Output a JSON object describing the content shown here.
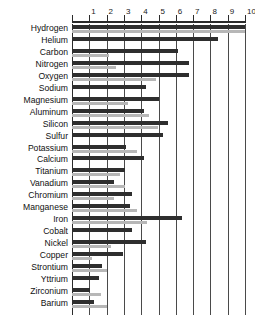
{
  "chart_data": {
    "type": "bar",
    "title": "",
    "subtitle": "",
    "xlabel": "",
    "ylabel": "",
    "orientation": "horizontal",
    "xlim": [
      0,
      10
    ],
    "grid": true,
    "grid_axis": "x",
    "axis_position": "top",
    "legend": "none",
    "tick_labels": [
      "1",
      "2",
      "3",
      "4",
      "5",
      "6",
      "7",
      "8",
      "9",
      "10"
    ],
    "tick_values": [
      1,
      2,
      3,
      4,
      5,
      6,
      7,
      8,
      9,
      10
    ],
    "categories": [
      "Hydrogen",
      "Helium",
      "Carbon",
      "Nitrogen",
      "Oxygen",
      "Sodium",
      "Magnesium",
      "Aluminum",
      "Silicon",
      "Sulfur",
      "Potassium",
      "Calcium",
      "Titanium",
      "Vanadium",
      "Chromium",
      "Manganese",
      "Iron",
      "Cobalt",
      "Nickel",
      "Copper",
      "Strontium",
      "Yttrium",
      "Zirconium",
      "Barium"
    ],
    "series": [
      {
        "name": "primary",
        "color": "#2e2e2e",
        "values": [
          10.0,
          8.45,
          6.15,
          6.75,
          6.75,
          4.25,
          5.05,
          4.15,
          5.55,
          5.25,
          3.15,
          4.15,
          3.05,
          2.45,
          3.45,
          3.35,
          6.35,
          3.45,
          4.25,
          2.95,
          1.75,
          1.55,
          1.05,
          1.25
        ]
      },
      {
        "name": "secondary",
        "color": "#b7b7b7",
        "values": [
          10.0,
          0.0,
          2.15,
          2.55,
          4.85,
          0.0,
          3.25,
          4.45,
          4.95,
          0.0,
          3.75,
          0.0,
          2.75,
          3.05,
          2.45,
          3.75,
          4.35,
          0.0,
          2.25,
          1.15,
          2.05,
          0.0,
          1.65,
          2.05
        ]
      }
    ],
    "colors": {
      "primary_bar": "#2e2e2e",
      "secondary_bar": "#b7b7b7",
      "grid": "#4a4a4a",
      "axis": "#2b2b2b",
      "text": "#111111",
      "background": "#ffffff"
    }
  }
}
